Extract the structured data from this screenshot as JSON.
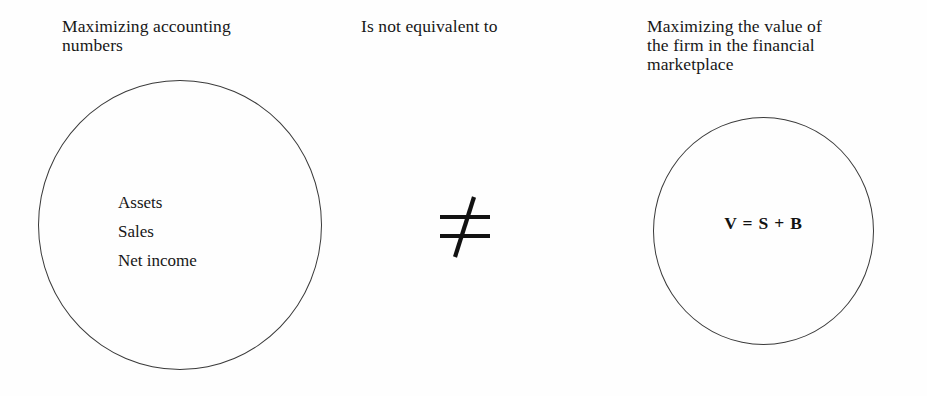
{
  "figure": {
    "type": "conceptual-comparison-diagram",
    "background_color": "#fefefe",
    "stroke_color": "#3a3a3a",
    "text_color": "#171717"
  },
  "left": {
    "heading": "Maximizing accounting\nnumbers",
    "items": [
      "Assets",
      "Sales",
      "Net income"
    ]
  },
  "middle": {
    "heading": "Is not equivalent to",
    "symbol": "≠",
    "symbol_name": "not-equal-sign"
  },
  "right": {
    "heading": "Maximizing the value of\nthe firm in the financial\nmarketplace",
    "formula": "V = S + B"
  }
}
